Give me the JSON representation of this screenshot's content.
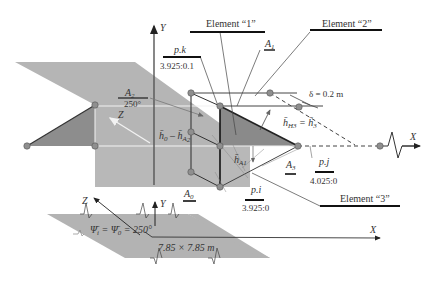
{
  "colors": {
    "plane": "#b3b3b3",
    "plane_dark": "#8c8c8c",
    "triangle": "#8a8a8a",
    "node": "#8f8f8f",
    "line": "#444444",
    "axis": "#555555",
    "white_line": "#f2f2f2",
    "label_bar": "#111111"
  },
  "axes": {
    "top_y": "Y",
    "top_z": "Z",
    "top_x": "X",
    "bottom_y": "Y",
    "bottom_z": "Z",
    "bottom_x": "X"
  },
  "elements": {
    "element1": "Element “1”",
    "element2": "Element “2”",
    "element3": "Element “3”"
  },
  "points": {
    "pk": {
      "name": "p.k",
      "coords": "3.925:0.1"
    },
    "pi": {
      "name": "p.i",
      "coords": "3.925:0"
    },
    "pj": {
      "name": "p.j",
      "coords": "4.025:0"
    }
  },
  "angles": {
    "a2_name": "A",
    "a2_sub": "2",
    "a2_value": "250°",
    "a1_name": "A",
    "a1_sub": "1",
    "a0_name": "A",
    "a0_sub": "0",
    "a3_name": "A",
    "a3_sub": "3"
  },
  "annotations": {
    "thickness": "δ = 0.2 m",
    "h0_text": "h̄",
    "h0_sub": "0",
    "h0_eq": " – h̄",
    "h0_eq_sub": "A",
    "h0_eq_subsub": "2",
    "hh3_text": "h̄",
    "hh3_sub": "H3",
    "hh3_eq": " = h̄",
    "hh3_eq_sub": "3",
    "ha1_text": "h̄",
    "ha1_sub": "A1"
  },
  "bottom_plate": {
    "psi_label": "Ψ̄",
    "psi_sub_i": "i",
    "psi_eq": " = Ψ̄",
    "psi_sub_0": "0",
    "psi_value": " = 250°",
    "size": "7.85 × 7.85 m"
  }
}
